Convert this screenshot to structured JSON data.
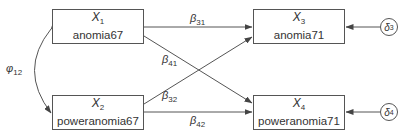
{
  "diagram": {
    "type": "path-diagram",
    "nodes": [
      {
        "id": "x1",
        "symbol": "X",
        "sub": "1",
        "name": "anomia67"
      },
      {
        "id": "x2",
        "symbol": "X",
        "sub": "2",
        "name": "poweranomia67"
      },
      {
        "id": "x3",
        "symbol": "X",
        "sub": "3",
        "name": "anomia71"
      },
      {
        "id": "x4",
        "symbol": "X",
        "sub": "4",
        "name": "poweranomia71"
      }
    ],
    "errors": [
      {
        "id": "d3",
        "symbol": "δ",
        "sub": "3",
        "target": "x3"
      },
      {
        "id": "d4",
        "symbol": "δ",
        "sub": "4",
        "target": "x4"
      }
    ],
    "paths": [
      {
        "from": "x1",
        "to": "x3",
        "symbol": "β",
        "sub": "31"
      },
      {
        "from": "x1",
        "to": "x4",
        "symbol": "β",
        "sub": "41"
      },
      {
        "from": "x2",
        "to": "x3",
        "symbol": "β",
        "sub": "32"
      },
      {
        "from": "x2",
        "to": "x4",
        "symbol": "β",
        "sub": "42"
      }
    ],
    "covariance": {
      "between": [
        "x1",
        "x2"
      ],
      "symbol": "φ",
      "sub": "12"
    },
    "colors": {
      "stroke": "#555555",
      "text": "#333333"
    }
  }
}
